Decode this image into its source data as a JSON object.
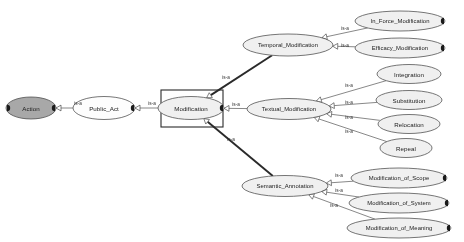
{
  "diagram": {
    "type": "is-a taxonomy graph",
    "background_color": "#ffffff",
    "relation_label": "is-a",
    "node_fill_root": "#a8a8a8",
    "node_fill_default": "#f2f2f2",
    "node_stroke": "#4a4a4a",
    "selection_box_color": "#2b2b2b",
    "nodes": [
      {
        "id": "action",
        "label": "Action",
        "cx": 31,
        "cy": 108,
        "rx": 25,
        "ry": 11,
        "fill": "#a8a8a8",
        "selected": false,
        "handle_left": true,
        "handle_right": true
      },
      {
        "id": "public_act",
        "label": "Public_Act",
        "cx": 104,
        "cy": 108,
        "rx": 31,
        "ry": 11.5,
        "fill": "#fdfdfd",
        "selected": false,
        "handle_left": false,
        "handle_right": true
      },
      {
        "id": "modification",
        "label": "Modification",
        "cx": 191,
        "cy": 108,
        "rx": 33,
        "ry": 11.5,
        "fill": "#f0f0f0",
        "selected": true,
        "handle_left": false,
        "handle_right": true
      },
      {
        "id": "temporal_modification",
        "label": "Temporal_Modification",
        "cx": 288,
        "cy": 45,
        "rx": 45,
        "ry": 11,
        "fill": "#f0f0f0",
        "selected": false,
        "handle_left": false,
        "handle_right": false
      },
      {
        "id": "textual_modification",
        "label": "Textual_Modification",
        "cx": 289,
        "cy": 109,
        "rx": 42,
        "ry": 10.5,
        "fill": "#f0f0f0",
        "selected": false,
        "handle_left": false,
        "handle_right": false
      },
      {
        "id": "semantic_annotation",
        "label": "Semantic_Annotation",
        "cx": 285,
        "cy": 186,
        "rx": 43,
        "ry": 10.5,
        "fill": "#f0f0f0",
        "selected": false,
        "handle_left": false,
        "handle_right": false
      },
      {
        "id": "in_force_modification",
        "label": "In_Force_Modification",
        "cx": 400,
        "cy": 21,
        "rx": 45,
        "ry": 10,
        "fill": "#f0f0f0",
        "selected": false,
        "handle_left": false,
        "handle_right": true
      },
      {
        "id": "efficacy_modification",
        "label": "Efficacy_Modification",
        "cx": 400,
        "cy": 48,
        "rx": 45,
        "ry": 10,
        "fill": "#f0f0f0",
        "selected": false,
        "handle_left": false,
        "handle_right": true
      },
      {
        "id": "integration",
        "label": "Integration",
        "cx": 409,
        "cy": 74,
        "rx": 32,
        "ry": 9.5,
        "fill": "#f0f0f0",
        "selected": false,
        "handle_left": false,
        "handle_right": false
      },
      {
        "id": "substitution",
        "label": "Substitution",
        "cx": 409,
        "cy": 100,
        "rx": 33,
        "ry": 9.5,
        "fill": "#f0f0f0",
        "selected": false,
        "handle_left": false,
        "handle_right": false
      },
      {
        "id": "relocation",
        "label": "Relocation",
        "cx": 409,
        "cy": 124,
        "rx": 31,
        "ry": 9.5,
        "fill": "#f0f0f0",
        "selected": false,
        "handle_left": false,
        "handle_right": false
      },
      {
        "id": "repeal",
        "label": "Repeal",
        "cx": 406,
        "cy": 148,
        "rx": 26,
        "ry": 9.5,
        "fill": "#f0f0f0",
        "selected": false,
        "handle_left": false,
        "handle_right": false
      },
      {
        "id": "modification_of_scope",
        "label": "Modification_of_Scope",
        "cx": 399,
        "cy": 178,
        "rx": 48,
        "ry": 10,
        "fill": "#f0f0f0",
        "selected": false,
        "handle_left": false,
        "handle_right": true
      },
      {
        "id": "modification_of_system",
        "label": "Modification_of_System",
        "cx": 399,
        "cy": 203,
        "rx": 50,
        "ry": 10,
        "fill": "#f0f0f0",
        "selected": false,
        "handle_left": false,
        "handle_right": true
      },
      {
        "id": "modification_of_meaning",
        "label": "Modification_of_Meaning",
        "cx": 399,
        "cy": 228,
        "rx": 52,
        "ry": 10,
        "fill": "#f0f0f0",
        "selected": false,
        "handle_left": false,
        "handle_right": true
      }
    ],
    "edges": [
      {
        "from": "public_act",
        "to": "action",
        "label": "is-a",
        "lx": 78,
        "ly": 103,
        "weight": "thin"
      },
      {
        "from": "modification",
        "to": "public_act",
        "label": "is-a",
        "lx": 152,
        "ly": 103,
        "weight": "thin"
      },
      {
        "from": "temporal_modification",
        "to": "modification",
        "label": "is-a",
        "lx": 226,
        "ly": 77,
        "weight": "thick"
      },
      {
        "from": "textual_modification",
        "to": "modification",
        "label": "is-a",
        "lx": 236,
        "ly": 104,
        "weight": "thin"
      },
      {
        "from": "semantic_annotation",
        "to": "modification",
        "label": "is-a",
        "lx": 231,
        "ly": 139,
        "weight": "thick"
      },
      {
        "from": "in_force_modification",
        "to": "temporal_modification",
        "label": "is-a",
        "lx": 345,
        "ly": 28,
        "weight": "thin"
      },
      {
        "from": "efficacy_modification",
        "to": "temporal_modification",
        "label": "is-a",
        "lx": 345,
        "ly": 45,
        "weight": "thin"
      },
      {
        "from": "integration",
        "to": "textual_modification",
        "label": "is-a",
        "lx": 349,
        "ly": 85,
        "weight": "thin"
      },
      {
        "from": "substitution",
        "to": "textual_modification",
        "label": "is-a",
        "lx": 349,
        "ly": 102,
        "weight": "thin"
      },
      {
        "from": "relocation",
        "to": "textual_modification",
        "label": "is-a",
        "lx": 349,
        "ly": 117,
        "weight": "thin"
      },
      {
        "from": "repeal",
        "to": "textual_modification",
        "label": "is-a",
        "lx": 349,
        "ly": 131,
        "weight": "thin"
      },
      {
        "from": "modification_of_scope",
        "to": "semantic_annotation",
        "label": "is-a",
        "lx": 339,
        "ly": 175,
        "weight": "thin"
      },
      {
        "from": "modification_of_system",
        "to": "semantic_annotation",
        "label": "is-a",
        "lx": 339,
        "ly": 190,
        "weight": "thin"
      },
      {
        "from": "modification_of_meaning",
        "to": "semantic_annotation",
        "label": "is-a",
        "lx": 334,
        "ly": 205,
        "weight": "thin"
      }
    ],
    "selection": {
      "node": "modification",
      "x": 161,
      "y": 90,
      "width": 62,
      "height": 37
    }
  }
}
